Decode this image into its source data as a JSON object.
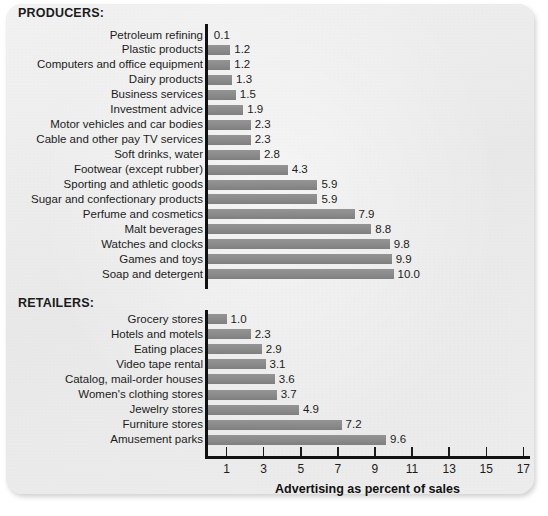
{
  "chart_data": {
    "type": "bar",
    "orientation": "horizontal",
    "title": "",
    "xlabel": "Advertising as percent of sales",
    "ylabel": "",
    "xlim": [
      0,
      17.6
    ],
    "xticks": [
      1,
      3,
      5,
      7,
      9,
      11,
      13,
      15,
      17
    ],
    "grid": false,
    "legend": null,
    "bar_color": "#8a8a8a",
    "axis_color": "#111111",
    "groups": [
      {
        "name": "PRODUCERS:",
        "categories": [
          "Petroleum refining",
          "Plastic products",
          "Computers and office equipment",
          "Dairy products",
          "Business services",
          "Investment advice",
          "Motor vehicles and car bodies",
          "Cable and other pay TV services",
          "Soft drinks, water",
          "Footwear (except rubber)",
          "Sporting and athletic goods",
          "Sugar and confectionary products",
          "Perfume and cosmetics",
          "Malt beverages",
          "Watches and clocks",
          "Games and toys",
          "Soap and detergent"
        ],
        "values": [
          0.1,
          1.2,
          1.2,
          1.3,
          1.5,
          1.9,
          2.3,
          2.3,
          2.8,
          4.3,
          5.9,
          5.9,
          7.9,
          8.8,
          9.8,
          9.9,
          10.0
        ],
        "labels": [
          "0.1",
          "1.2",
          "1.2",
          "1.3",
          "1.5",
          "1.9",
          "2.3",
          "2.3",
          "2.8",
          "4.3",
          "5.9",
          "5.9",
          "7.9",
          "8.8",
          "9.8",
          "9.9",
          "10.0"
        ]
      },
      {
        "name": "RETAILERS:",
        "categories": [
          "Grocery stores",
          "Hotels and motels",
          "Eating places",
          "Video tape rental",
          "Catalog, mail-order houses",
          "Women's clothing stores",
          "Jewelry stores",
          "Furniture stores",
          "Amusement parks"
        ],
        "values": [
          1.0,
          2.3,
          2.9,
          3.1,
          3.6,
          3.7,
          4.9,
          7.2,
          9.6
        ],
        "labels": [
          "1.0",
          "2.3",
          "2.9",
          "3.1",
          "3.6",
          "3.7",
          "4.9",
          "7.2",
          "9.6"
        ]
      }
    ]
  }
}
